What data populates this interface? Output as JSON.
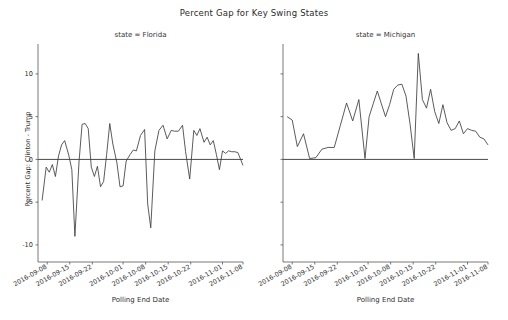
{
  "figure": {
    "title": "Percent Gap for Key Swing States",
    "xlabel": "Polling End Date",
    "ylabel": "Percent Gap: Clinton - Trump"
  },
  "panels": [
    {
      "title": "state = Florida"
    },
    {
      "title": "state = Michigan"
    }
  ],
  "chart_data": {
    "type": "line",
    "title": "Percent Gap for Key Swing States",
    "xlabel": "Polling End Date",
    "ylabel": "Percent Gap: Clinton - Trump",
    "grid": false,
    "legend": null,
    "ylim": [
      -12,
      13.5
    ],
    "ytick_labels": [
      "10",
      "5",
      "0",
      "-5",
      "-10"
    ],
    "ytick_values": [
      10,
      5,
      0,
      -5,
      -10
    ],
    "xtick_labels": [
      "2016-09-08",
      "2016-09-15",
      "2016-09-22",
      "2016-10-01",
      "2016-10-08",
      "2016-10-15",
      "2016-10-22",
      "2016-11-01",
      "2016-11-08"
    ],
    "xtick_positions": [
      0.045,
      0.155,
      0.265,
      0.415,
      0.525,
      0.635,
      0.745,
      0.9,
      1.0
    ],
    "panels": [
      {
        "name": "Florida",
        "title": "state = Florida",
        "x": [
          0.02,
          0.04,
          0.055,
          0.07,
          0.085,
          0.1,
          0.115,
          0.13,
          0.15,
          0.165,
          0.18,
          0.2,
          0.215,
          0.23,
          0.245,
          0.26,
          0.275,
          0.29,
          0.305,
          0.32,
          0.335,
          0.35,
          0.365,
          0.385,
          0.4,
          0.415,
          0.43,
          0.45,
          0.465,
          0.48,
          0.5,
          0.52,
          0.535,
          0.55,
          0.57,
          0.59,
          0.61,
          0.63,
          0.65,
          0.665,
          0.685,
          0.705,
          0.72,
          0.74,
          0.76,
          0.775,
          0.79,
          0.81,
          0.825,
          0.84,
          0.855,
          0.87,
          0.885,
          0.9,
          0.915,
          0.93,
          0.945,
          0.96,
          0.975,
          1.0
        ],
        "y": [
          -4.8,
          -0.9,
          -1.5,
          -0.6,
          -2.0,
          0.4,
          1.7,
          2.2,
          0.5,
          -1.2,
          -9.0,
          -0.3,
          4.1,
          4.2,
          3.6,
          -0.9,
          -2.0,
          -0.8,
          -3.2,
          -2.6,
          0.6,
          4.2,
          1.8,
          -0.4,
          -3.2,
          -3.1,
          -0.2,
          0.6,
          1.1,
          1.0,
          2.8,
          3.5,
          -5.2,
          -8.0,
          1.0,
          3.4,
          4.0,
          2.4,
          3.4,
          3.3,
          3.3,
          4.0,
          0.9,
          -2.3,
          3.4,
          2.8,
          3.6,
          2.0,
          2.6,
          1.7,
          2.2,
          0.6,
          -1.2,
          1.0,
          0.7,
          1.0,
          0.9,
          0.9,
          0.8,
          -0.7
        ]
      },
      {
        "name": "Michigan",
        "title": "state = Michigan",
        "x": [
          0.02,
          0.045,
          0.07,
          0.1,
          0.13,
          0.16,
          0.19,
          0.22,
          0.25,
          0.28,
          0.31,
          0.34,
          0.37,
          0.4,
          0.42,
          0.44,
          0.46,
          0.48,
          0.5,
          0.52,
          0.54,
          0.56,
          0.58,
          0.6,
          0.62,
          0.64,
          0.66,
          0.68,
          0.7,
          0.72,
          0.74,
          0.76,
          0.78,
          0.8,
          0.82,
          0.84,
          0.86,
          0.88,
          0.9,
          0.92,
          0.94,
          0.96,
          0.98,
          1.0
        ],
        "y": [
          5.0,
          4.6,
          1.5,
          3.0,
          0.1,
          0.2,
          1.2,
          1.4,
          1.4,
          4.0,
          6.6,
          4.5,
          7.0,
          0.1,
          5.0,
          6.5,
          8.0,
          6.5,
          5.0,
          6.4,
          8.2,
          8.7,
          8.8,
          7.4,
          4.1,
          0.1,
          12.4,
          7.0,
          6.0,
          8.2,
          5.6,
          4.2,
          6.4,
          4.3,
          3.4,
          3.6,
          4.5,
          3.0,
          3.6,
          3.4,
          3.3,
          2.6,
          2.4,
          1.7
        ]
      }
    ]
  }
}
